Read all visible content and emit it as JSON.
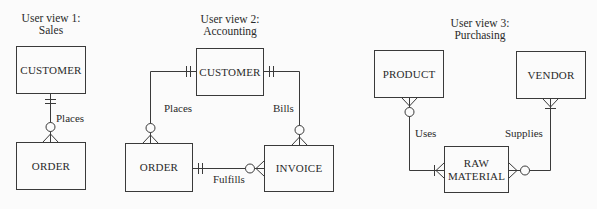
{
  "views": [
    {
      "title_line1": "User view 1:",
      "title_line2": "Sales",
      "entities": [
        {
          "name": "CUSTOMER"
        },
        {
          "name": "ORDER"
        }
      ],
      "relationships": [
        {
          "label": "Places",
          "from": "CUSTOMER",
          "to": "ORDER",
          "from_cardinality": "one-and-only-one",
          "to_cardinality": "zero-or-many"
        }
      ]
    },
    {
      "title_line1": "User view 2:",
      "title_line2": "Accounting",
      "entities": [
        {
          "name": "CUSTOMER"
        },
        {
          "name": "ORDER"
        },
        {
          "name": "INVOICE"
        }
      ],
      "relationships": [
        {
          "label": "Places",
          "from": "CUSTOMER",
          "to": "ORDER",
          "from_cardinality": "one-and-only-one",
          "to_cardinality": "zero-or-many"
        },
        {
          "label": "Bills",
          "from": "CUSTOMER",
          "to": "INVOICE",
          "from_cardinality": "one-and-only-one",
          "to_cardinality": "zero-or-many"
        },
        {
          "label": "Fulfills",
          "from": "ORDER",
          "to": "INVOICE",
          "from_cardinality": "one-and-only-one",
          "to_cardinality": "zero-or-many"
        }
      ]
    },
    {
      "title_line1": "User view 3:",
      "title_line2": "Purchasing",
      "entities": [
        {
          "name": "PRODUCT"
        },
        {
          "name": "VENDOR"
        },
        {
          "name": "RAW MATERIAL",
          "line1": "RAW",
          "line2": "MATERIAL"
        }
      ],
      "relationships": [
        {
          "label": "Uses",
          "from": "RAW MATERIAL",
          "to": "PRODUCT",
          "from_cardinality": "one-or-many",
          "to_cardinality": "zero-or-many"
        },
        {
          "label": "Supplies",
          "from": "VENDOR",
          "to": "RAW MATERIAL",
          "from_cardinality": "one-or-many",
          "to_cardinality": "zero-or-many"
        }
      ]
    }
  ],
  "colors": {
    "background": "#fbfbfb",
    "stroke": "#3a3a3a",
    "text": "#2a2a2a"
  }
}
